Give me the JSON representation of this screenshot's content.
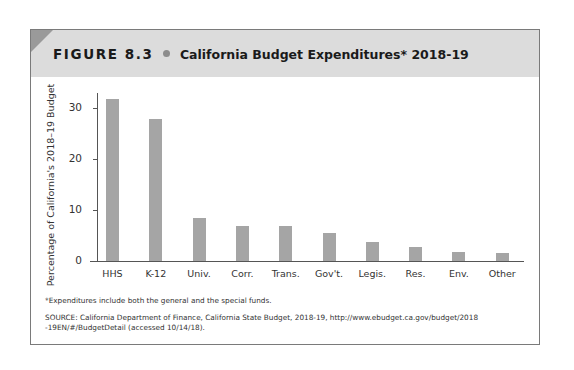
{
  "figure": {
    "label": "FIGURE 8.3",
    "title": "California Budget Expenditures* 2018-19"
  },
  "notes": {
    "footnote": "*Expenditures include both the general and the special funds.",
    "source_line1": "SOURCE: California Department of Finance, California State Budget, 2018-19, http://www.ebudget.ca.gov/budget/2018",
    "source_line2": "-19EN/#/BudgetDetail  (accessed 10/14/18)."
  },
  "colors": {
    "bar": "#a5a5a5",
    "header_band": "#dcdcdc",
    "frame_border": "#7a7a7a"
  },
  "chart_data": {
    "type": "bar",
    "title": "California Budget Expenditures* 2018-19",
    "xlabel": "",
    "ylabel": "Percentage of California's 2018–19 Budget",
    "categories": [
      "HHS",
      "K-12",
      "Univ.",
      "Corr.",
      "Trans.",
      "Gov't.",
      "Legis.",
      "Res.",
      "Env.",
      "Other"
    ],
    "values": [
      31.7,
      27.8,
      8.4,
      6.9,
      6.8,
      5.5,
      3.7,
      2.7,
      1.7,
      1.6
    ],
    "yticks": [
      "0",
      "10",
      "20",
      "30"
    ],
    "ylim": [
      0,
      33
    ],
    "grid": false,
    "legend": null
  }
}
